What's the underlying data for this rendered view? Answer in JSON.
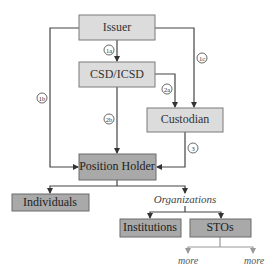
{
  "diagram": {
    "nodes": {
      "issuer": "Issuer",
      "csd": "CSD/ICSD",
      "custodian": "Custodian",
      "position_holder": "Position Holder",
      "individuals": "Individuals",
      "organizations": "Organizations",
      "institutions": "Institutions",
      "stos": "STOs",
      "more_left": "more",
      "more_right": "more"
    },
    "edge_labels": {
      "e1a": "1a",
      "e1b": "1b",
      "e1c": "1c",
      "e2a": "2a",
      "e2b": "2b",
      "e3": "3"
    },
    "colors": {
      "light_box": "#dcdcdc",
      "dark_box": "#a9a9a9",
      "line": "#444444"
    }
  }
}
